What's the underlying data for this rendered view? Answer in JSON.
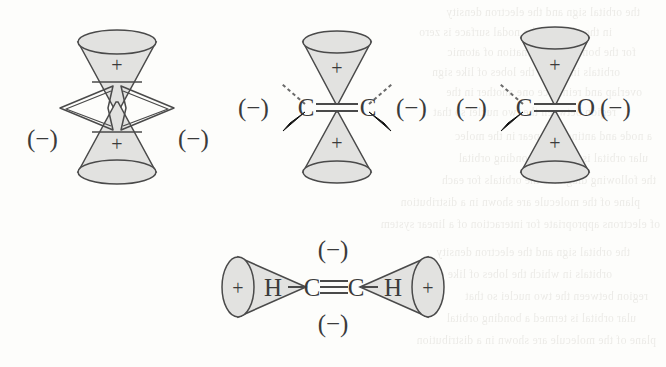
{
  "figure": {
    "background_color": "#fdfdfb",
    "lobe_fill_color": "#e2e2e0",
    "stroke_color": "#4a4a4a",
    "label_color": "#3b3b3b"
  },
  "structures": [
    {
      "id": "structure-1",
      "name": "vertical-double-cone-with-side-lobes",
      "top_lobe_sign": "+",
      "bottom_lobe_sign": "+",
      "left_charge": "(−)",
      "right_charge": "(−)",
      "atoms": []
    },
    {
      "id": "structure-2",
      "name": "ethylene-c-double-bond-c",
      "top_lobe_sign": "+",
      "bottom_lobe_sign": "+",
      "left_charge": "(−)",
      "right_charge": "(−)",
      "atoms": [
        "C",
        "C"
      ],
      "bond": "double"
    },
    {
      "id": "structure-3",
      "name": "carbonyl-c-double-bond-o",
      "top_lobe_sign": "+",
      "bottom_lobe_sign": "+",
      "left_charge": "(−)",
      "right_charge": "(−)",
      "atoms": [
        "C",
        "O"
      ],
      "bond": "double"
    },
    {
      "id": "structure-4",
      "name": "acetylene-h-c-triple-bond-c-h",
      "left_lobe_sign": "+",
      "right_lobe_sign": "+",
      "top_charge": "(−)",
      "bottom_charge": "(−)",
      "atoms": [
        "H",
        "C",
        "C",
        "H"
      ],
      "bond": "triple"
    }
  ],
  "bleed_text": {
    "lines": [
      "the orbital sign and the electron density",
      "in the plane of the nodal surface is zero",
      "for the bonding combination of atomic",
      "orbitals in which the lobes of like sign",
      "overlap and reinforce one another in the",
      "region between the two nuclei so that",
      "a node and antinode appear in the molec",
      "ular orbital is termed a bonding orbital",
      "the following diagrams the orbitals for each",
      "plane of the molecule are shown in a distribution",
      "of electrons appropriate for interaction of a linear system"
    ]
  }
}
